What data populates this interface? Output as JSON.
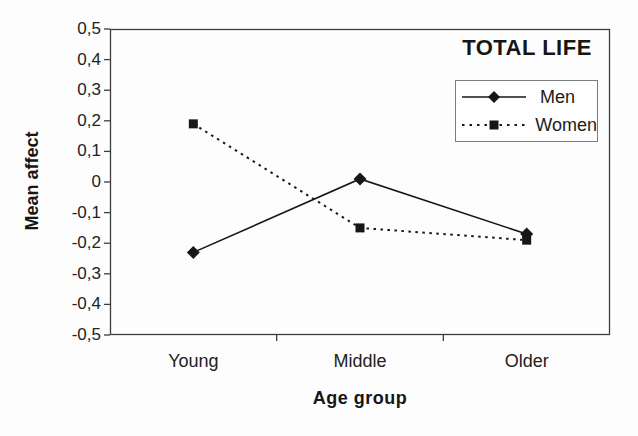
{
  "chart_data": {
    "type": "line",
    "title": "TOTAL LIFE",
    "xlabel": "Age group",
    "ylabel": "Mean affect",
    "categories": [
      "Young",
      "Middle",
      "Older"
    ],
    "series": [
      {
        "name": "Men",
        "values": [
          -0.23,
          0.01,
          -0.17
        ],
        "line": "solid",
        "marker": "diamond"
      },
      {
        "name": "Women",
        "values": [
          0.19,
          -0.15,
          -0.19
        ],
        "line": "dotted",
        "marker": "square"
      }
    ],
    "ylim": [
      -0.5,
      0.5
    ],
    "ytick_step": 0.1,
    "ytick_labels": [
      "0,5",
      "0,4",
      "0,3",
      "0,2",
      "0,1",
      "0",
      "-0,1",
      "-0,2",
      "-0,3",
      "-0,4",
      "-0,5"
    ],
    "decimal_separator": ",",
    "grid": false,
    "legend_position": "top-right-inside",
    "line_color": "#161616",
    "axis_color": "#3d3d3d",
    "background_color": "#fdfdfd"
  }
}
